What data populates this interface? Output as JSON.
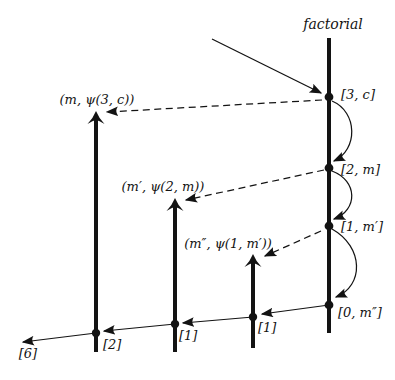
{
  "figure": {
    "colors": {
      "ink": "#131313",
      "background": "#ffffff"
    },
    "process": {
      "label": "factorial",
      "events": [
        {
          "label": "[3, c]"
        },
        {
          "label": "[2, m]"
        },
        {
          "label": "[1, m′]"
        },
        {
          "label": "[0, m″]"
        }
      ]
    },
    "continuations": [
      {
        "label": "(m, ψ(3, c))",
        "result": "[2]"
      },
      {
        "label": "(m′, ψ(2, m))",
        "result": "[1]"
      },
      {
        "label": "(m″, ψ(1, m′))",
        "result": "[1]"
      }
    ],
    "final_result": "[6]"
  }
}
